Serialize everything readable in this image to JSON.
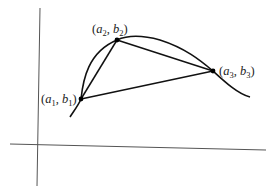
{
  "figure": {
    "axes": {
      "vertical": {
        "x1": 40,
        "y1": 8,
        "x2": 37,
        "y2": 186
      },
      "horizontal": {
        "x1": 10,
        "y1": 144,
        "x2": 266,
        "y2": 150
      }
    },
    "points": [
      {
        "id": "p1",
        "label": "(a1, b1)",
        "var_a": "a",
        "sub_a": "1",
        "var_b": "b",
        "sub_b": "1",
        "x": 81,
        "y": 99
      },
      {
        "id": "p2",
        "label": "(a2, b2)",
        "var_a": "a",
        "sub_a": "2",
        "var_b": "b",
        "sub_b": "2",
        "x": 117,
        "y": 40
      },
      {
        "id": "p3",
        "label": "(a3, b3)",
        "var_a": "a",
        "sub_a": "3",
        "var_b": "b",
        "sub_b": "3",
        "x": 213,
        "y": 71
      }
    ],
    "curve_path": "M70,117 C76,108 79,104 81,99 C83,80 88,52 117,40 C128,35 142,35 160,40 C185,48 200,60 213,71 C225,82 238,94 250,97",
    "colors": {
      "stroke": "#111111",
      "axis": "#555555",
      "background": "#ffffff"
    }
  }
}
